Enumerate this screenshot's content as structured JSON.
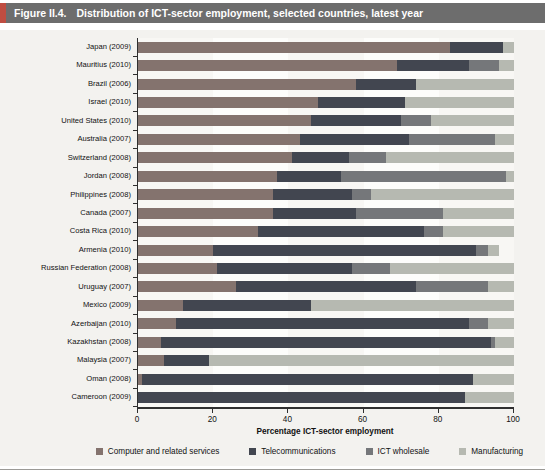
{
  "header": {
    "figure_label": "Figure II.4.",
    "title": "Distribution of ICT-sector employment, selected countries, latest year"
  },
  "colors": {
    "title_bar_bg": "#6d6d6d",
    "title_accent": "#bf4d41",
    "panel_bg": "#f3f2ef",
    "axis": "#2f2f2f",
    "series": [
      "#84736e",
      "#424650",
      "#75777a",
      "#b6b9b1"
    ]
  },
  "chart_data": {
    "type": "bar",
    "orientation": "horizontal",
    "stacked": true,
    "title": "Distribution of ICT-sector employment, selected countries, latest year",
    "xlabel": "Percentage ICT-sector employment",
    "ylabel": "",
    "xlim": [
      0,
      100
    ],
    "xticks": [
      0,
      20,
      40,
      60,
      80,
      100
    ],
    "grid": false,
    "legend_position": "bottom",
    "categories": [
      "Japan (2009)",
      "Mauritius (2010)",
      "Brazil (2006)",
      "Israel (2010)",
      "United States (2010)",
      "Australia (2007)",
      "Switzerland (2008)",
      "Jordan (2008)",
      "Philippines (2008)",
      "Canada (2007)",
      "Costa Rica (2010)",
      "Armenia (2010)",
      "Russian Federation (2008)",
      "Uruguay (2007)",
      "Mexico (2009)",
      "Azerbaijan (2010)",
      "Kazakhstan (2008)",
      "Malaysia (2007)",
      "Oman (2008)",
      "Cameroon (2009)"
    ],
    "series": [
      {
        "name": "Computer and related services",
        "values": [
          83,
          69,
          58,
          48,
          46,
          43,
          41,
          37,
          36,
          36,
          32,
          20,
          21,
          26,
          12,
          10,
          6,
          7,
          1,
          0
        ]
      },
      {
        "name": "Telecommunications",
        "values": [
          14,
          19,
          16,
          23,
          24,
          29,
          15,
          17,
          21,
          22,
          44,
          70,
          36,
          48,
          34,
          78,
          88,
          12,
          88,
          87
        ]
      },
      {
        "name": "ICT wholesale",
        "values": [
          0,
          8,
          0,
          0,
          8,
          23,
          10,
          44,
          5,
          23,
          5,
          3,
          10,
          19,
          0,
          5,
          1,
          0,
          0,
          0
        ]
      },
      {
        "name": "Manufacturing",
        "values": [
          3,
          4,
          26,
          29,
          22,
          5,
          34,
          2,
          38,
          19,
          19,
          3,
          33,
          7,
          54,
          7,
          5,
          81,
          11,
          13
        ]
      }
    ]
  }
}
